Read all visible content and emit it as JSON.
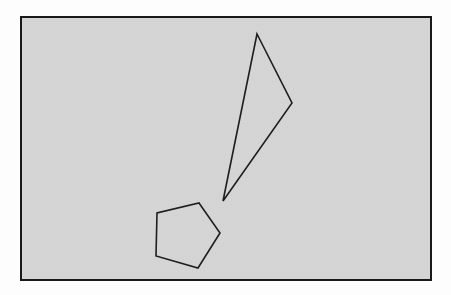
{
  "figure": {
    "canvas": {
      "width": 451,
      "height": 295,
      "background_color": "#ffffff"
    },
    "frame": {
      "name": "outer-rectangle-frame",
      "x": 21,
      "y": 17,
      "width": 410,
      "height": 263,
      "fill_color": "#d6d6d6",
      "stroke_color": "#1a1a1a",
      "stroke_width": 2
    },
    "shapes": [
      {
        "name": "triangle",
        "label": "Thin triangle",
        "sides": 3,
        "points": "257,34 292,103 223,201",
        "vertices": [
          {
            "x": 257,
            "y": 34,
            "role": "apex-top"
          },
          {
            "x": 292,
            "y": 103,
            "role": "vertex-right"
          },
          {
            "x": 223,
            "y": 201,
            "role": "tip-bottom"
          }
        ],
        "fill_color": "none",
        "stroke_color": "#1f1f1f",
        "stroke_width": 1.6
      },
      {
        "name": "pentagon",
        "label": "Pentagon",
        "sides": 5,
        "points": "199,203 220,233 198,268 156,256 157,213",
        "vertices": [
          {
            "x": 199,
            "y": 203,
            "role": "vertex-top"
          },
          {
            "x": 220,
            "y": 233,
            "role": "vertex-right"
          },
          {
            "x": 198,
            "y": 268,
            "role": "vertex-bottom-right"
          },
          {
            "x": 156,
            "y": 256,
            "role": "vertex-bottom-left"
          },
          {
            "x": 157,
            "y": 213,
            "role": "vertex-left"
          }
        ],
        "fill_color": "none",
        "stroke_color": "#1f1f1f",
        "stroke_width": 1.6
      }
    ]
  }
}
